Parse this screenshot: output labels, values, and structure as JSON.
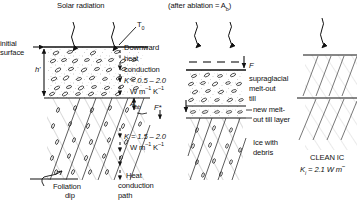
{
  "figure": {
    "title_solar": "Solar radiation",
    "header_middle": "(after ablation = A",
    "header_middle_sub": "b",
    "header_middle_end": ")"
  },
  "left_panel": {
    "initial_surface_label": "initial",
    "initial_surface_label2": "surface",
    "thickness_label": "h'",
    "surface_temp_label": "T",
    "surface_temp_sub": "0",
    "downward_label1": "Downward",
    "downward_label2": "heat",
    "downward_label3": "conduction",
    "k_upper": "K = 0.5 – 2.0",
    "k_upper_units_pre": "W m",
    "k_upper_units_sup1": "–1",
    "k_upper_units_mid": " K",
    "k_upper_units_sup2": "–1",
    "abb_label": "A",
    "abb_sub": "bb",
    "fstar_label": "F*",
    "k_lower": "K = 1.5 – 2.0",
    "k_lower_units_pre": "W m",
    "k_lower_units_sup1": "–1",
    "k_lower_units_mid": " K",
    "k_lower_units_sup2": "–1",
    "foliation_label1": "Foliation",
    "foliation_label2": "dip",
    "heat_path1": "Heat",
    "heat_path2": "conduction",
    "heat_path3": "path"
  },
  "middle_panel": {
    "flux_label": "F",
    "supraglacial1": "supraglacial",
    "supraglacial2": "melt-out",
    "supraglacial3": "till",
    "new_layer1": "new melt-",
    "new_layer2": "out till layer",
    "ice_debris1": "Ice with",
    "ice_debris2": "debris"
  },
  "right_panel": {
    "clean_ice_label": "CLEAN IC",
    "conductivity_label": "K",
    "conductivity_sub": "i",
    "conductivity_value": " = 2.1 W m",
    "conductivity_sup": "–"
  },
  "colors": {
    "ink": "#111111",
    "background": "#ffffff",
    "stipple": "#9a9a9a",
    "hatch": "#bdbdbd"
  }
}
